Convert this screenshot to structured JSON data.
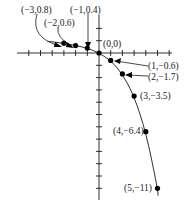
{
  "chart_data": {
    "type": "line",
    "title": "",
    "xlabel": "",
    "ylabel": "",
    "grid": false,
    "legend": null,
    "xlim": [
      -7,
      6
    ],
    "ylim": [
      -12,
      3
    ],
    "x_tick_step": 1,
    "y_tick_step": 1,
    "series": [
      {
        "name": "curve",
        "x": [
          -3,
          -2,
          -1,
          0,
          1,
          2,
          3,
          4,
          5
        ],
        "y": [
          0.8,
          0.6,
          0.4,
          0,
          -0.6,
          -1.7,
          -3.5,
          -6.4,
          -11
        ]
      }
    ],
    "annotations": [
      {
        "text": "(−3,0.8)",
        "x": -3,
        "y": 0.8
      },
      {
        "text": "(−2,0.6)",
        "x": -2,
        "y": 0.6
      },
      {
        "text": "(−1,0.4)",
        "x": -1,
        "y": 0.4
      },
      {
        "text": "(0,0)",
        "x": 0,
        "y": 0
      },
      {
        "text": "(1,−0.6)",
        "x": 1,
        "y": -0.6
      },
      {
        "text": "(2,−1.7)",
        "x": 2,
        "y": -1.7
      },
      {
        "text": "(3,−3.5)",
        "x": 3,
        "y": -3.5
      },
      {
        "text": "(4,−6.4)",
        "x": 4,
        "y": -6.4
      },
      {
        "text": "(5,−11)",
        "x": 5,
        "y": -11
      }
    ]
  },
  "labels": {
    "p_m3": "(−3,0.8)",
    "p_m2": "(−2,0.6)",
    "p_m1": "(−1,0.4)",
    "p_0": "(0,0)",
    "p_1": "(1,−0.6)",
    "p_2": "(2,−1.7)",
    "p_3": "(3,−3.5)",
    "p_4": "(4,−6.4)",
    "p_5": "(5,−11)"
  }
}
